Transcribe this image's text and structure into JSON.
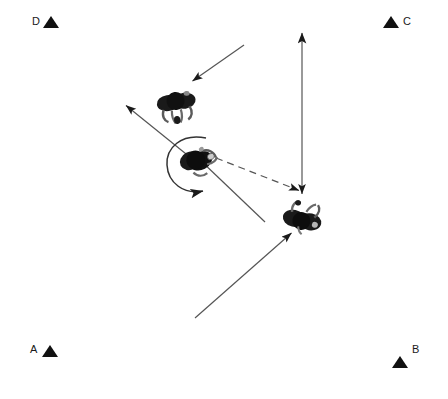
{
  "canvas": {
    "width": 448,
    "height": 399,
    "background": "#ffffff",
    "ink": "#111111",
    "line_color": "#555555"
  },
  "corner_markers": [
    {
      "id": "d",
      "label": "D",
      "x": 32,
      "y": 16,
      "label_side": "left",
      "triangle": "up"
    },
    {
      "id": "c",
      "label": "C",
      "x": 383,
      "y": 16,
      "label_side": "right",
      "triangle": "up"
    },
    {
      "id": "a",
      "label": "A",
      "x": 30,
      "y": 344,
      "label_side": "left",
      "triangle": "up"
    },
    {
      "id": "b",
      "label": "B",
      "x": 392,
      "y": 344,
      "label_side": "right",
      "triangle": "up"
    }
  ],
  "figures": [
    {
      "id": "figure-top",
      "cx": 176,
      "cy": 104,
      "rotation_deg": -8,
      "description": "overhead view of person"
    },
    {
      "id": "figure-center",
      "cx": 198,
      "cy": 160,
      "rotation_deg": -28,
      "description": "overhead view of person with rotation arc"
    },
    {
      "id": "figure-right",
      "cx": 302,
      "cy": 218,
      "rotation_deg": 12,
      "description": "overhead view of person"
    }
  ],
  "arrows": [
    {
      "id": "arrow-incoming-top",
      "style": "solid",
      "head": "end",
      "from": {
        "x": 244,
        "y": 45
      },
      "to": {
        "x": 191,
        "y": 82
      }
    },
    {
      "id": "arrow-up-left",
      "style": "solid",
      "head": "end",
      "from": {
        "x": 196,
        "y": 162
      },
      "to": {
        "x": 124,
        "y": 104
      }
    },
    {
      "id": "arrow-down-right",
      "style": "solid",
      "head": "none",
      "from": {
        "x": 198,
        "y": 158
      },
      "to": {
        "x": 265,
        "y": 222
      }
    },
    {
      "id": "arrow-dashed-to-right-figure",
      "style": "dashed",
      "head": "end",
      "from": {
        "x": 215,
        "y": 158
      },
      "to": {
        "x": 301,
        "y": 192
      }
    },
    {
      "id": "arrow-vertical-double",
      "style": "solid",
      "head": "both",
      "from": {
        "x": 302,
        "y": 196
      },
      "to": {
        "x": 302,
        "y": 30
      }
    },
    {
      "id": "arrow-incoming-bottom",
      "style": "solid",
      "head": "end",
      "from": {
        "x": 195,
        "y": 318
      },
      "to": {
        "x": 290,
        "y": 234
      }
    },
    {
      "id": "arc-rotation",
      "style": "solid-arc",
      "head": "end",
      "center": {
        "x": 195,
        "y": 163
      },
      "radius": 26,
      "description": "counterclockwise rotation arc around center figure"
    }
  ]
}
